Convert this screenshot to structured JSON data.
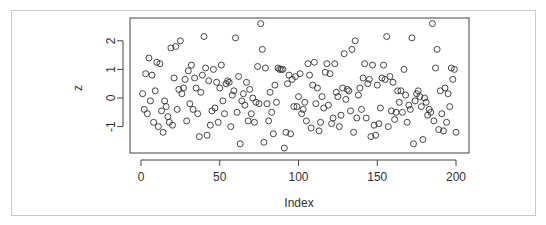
{
  "chart_data": {
    "type": "scatter",
    "title": "",
    "xlabel": "Index",
    "ylabel": "z",
    "xlim": [
      -4,
      206
    ],
    "ylim": [
      -1.9,
      2.8
    ],
    "xticks": [
      0,
      50,
      100,
      150,
      200
    ],
    "yticks": [
      -1,
      0,
      1,
      2
    ],
    "grid": false,
    "legend": null,
    "marker": "open-circle",
    "x": [
      1,
      2,
      3,
      4,
      5,
      6,
      7,
      8,
      9,
      10,
      11,
      12,
      13,
      14,
      15,
      16,
      17,
      18,
      19,
      20,
      21,
      22,
      23,
      24,
      25,
      26,
      27,
      28,
      29,
      30,
      31,
      32,
      33,
      34,
      35,
      36,
      37,
      38,
      39,
      40,
      41,
      42,
      43,
      44,
      45,
      46,
      47,
      48,
      49,
      50,
      51,
      52,
      53,
      54,
      55,
      56,
      57,
      58,
      59,
      60,
      61,
      62,
      63,
      64,
      65,
      66,
      67,
      68,
      69,
      70,
      71,
      72,
      73,
      74,
      75,
      76,
      77,
      78,
      79,
      80,
      81,
      82,
      83,
      84,
      85,
      86,
      87,
      88,
      89,
      90,
      91,
      92,
      93,
      94,
      95,
      96,
      97,
      98,
      99,
      100,
      101,
      102,
      103,
      104,
      105,
      106,
      107,
      108,
      109,
      110,
      111,
      112,
      113,
      114,
      115,
      116,
      117,
      118,
      119,
      120,
      121,
      122,
      123,
      124,
      125,
      126,
      127,
      128,
      129,
      130,
      131,
      132,
      133,
      134,
      135,
      136,
      137,
      138,
      139,
      140,
      141,
      142,
      143,
      144,
      145,
      146,
      147,
      148,
      149,
      150,
      151,
      152,
      153,
      154,
      155,
      156,
      157,
      158,
      159,
      160,
      161,
      162,
      163,
      164,
      165,
      166,
      167,
      168,
      169,
      170,
      171,
      172,
      173,
      174,
      175,
      176,
      177,
      178,
      179,
      180,
      181,
      182,
      183,
      184,
      185,
      186,
      187,
      188,
      189,
      190,
      191,
      192,
      193,
      194,
      195,
      196,
      197,
      198,
      199,
      200
    ],
    "y": [
      0.15,
      -0.4,
      0.85,
      -0.55,
      1.4,
      -0.1,
      0.8,
      -0.85,
      0.25,
      1.25,
      -1.0,
      1.2,
      -0.45,
      -1.2,
      -0.1,
      -0.3,
      -0.65,
      -0.85,
      1.75,
      -0.95,
      0.7,
      1.8,
      -0.4,
      0.3,
      2.0,
      0.15,
      0.35,
      0.65,
      -0.8,
      0.95,
      -0.2,
      1.15,
      -0.4,
      0.7,
      0.35,
      -0.55,
      -1.35,
      0.2,
      0.8,
      2.15,
      1.05,
      -1.3,
      0.6,
      -0.95,
      -0.45,
      1.0,
      -0.35,
      0.55,
      -0.85,
      0.35,
      1.15,
      -0.1,
      -0.55,
      0.5,
      0.6,
      0.55,
      -1.0,
      0.1,
      0.25,
      2.1,
      -0.5,
      0.75,
      -1.6,
      -0.1,
      0.15,
      -0.25,
      0.55,
      -0.8,
      0.3,
      -0.55,
      0.0,
      -0.85,
      -0.15,
      1.1,
      -0.2,
      2.6,
      1.7,
      -1.55,
      1.05,
      -0.2,
      -0.8,
      0.2,
      -0.5,
      -1.25,
      0.45,
      -0.15,
      1.05,
      1.0,
      1.0,
      1.0,
      -1.75,
      -1.2,
      0.5,
      0.8,
      -1.25,
      0.65,
      -0.3,
      0.75,
      -0.3,
      0.05,
      0.85,
      -0.55,
      -0.4,
      -0.15,
      -0.8,
      1.2,
      0.8,
      -1.05,
      0.45,
      1.25,
      -0.2,
      0.35,
      -1.15,
      -0.85,
      0.05,
      -0.35,
      0.9,
      1.2,
      -0.25,
      0.85,
      -0.9,
      -0.7,
      1.2,
      0.2,
      0.05,
      -1.0,
      -0.6,
      0.35,
      1.55,
      -0.05,
      0.3,
      0.25,
      -0.45,
      1.7,
      -1.2,
      2.0,
      -0.7,
      0.1,
      0.35,
      -0.4,
      0.7,
      1.2,
      -0.7,
      0.5,
      0.65,
      -1.35,
      1.15,
      -0.95,
      -1.3,
      0.45,
      -0.9,
      -0.35,
      0.7,
      1.15,
      0.65,
      2.15,
      -1.0,
      0.75,
      -0.45,
      0.55,
      -0.75,
      -0.5,
      0.25,
      -0.15,
      0.25,
      -0.5,
      1.0,
      0.1,
      -0.85,
      -0.25,
      -0.4,
      2.1,
      -1.6,
      -0.1,
      0.15,
      0.25,
      0.05,
      -0.3,
      -1.45,
      0.0,
      -0.15,
      -0.6,
      -0.4,
      -0.5,
      2.6,
      -0.8,
      1.05,
      1.7,
      -1.1,
      0.25,
      -0.55,
      -1.15,
      0.35,
      -0.85,
      0.15,
      -0.3,
      1.05,
      0.65,
      1.0,
      -1.2,
      -1.65,
      0.6,
      -1.1,
      0.95,
      -1.2,
      -0.9,
      0.7,
      -0.2,
      0.65,
      -0.25
    ]
  },
  "plot_area": {
    "x_tick_labels": [
      "0",
      "50",
      "100",
      "150",
      "200"
    ],
    "y_tick_labels": [
      "-1",
      "0",
      "1",
      "2"
    ],
    "xlabel": "Index",
    "ylabel": "z"
  },
  "colors": {
    "marker_stroke": "#333333",
    "axis": "#444444",
    "frame": "#c9c9c9",
    "background": "#ffffff"
  }
}
